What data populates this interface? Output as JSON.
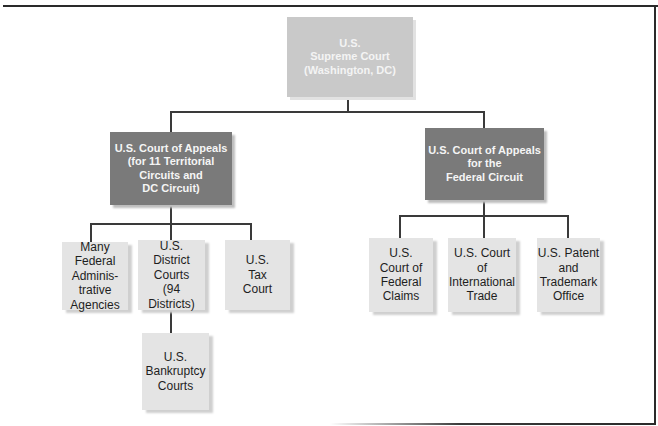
{
  "diagram": {
    "type": "org-chart",
    "colors": {
      "top_box": "#c9c9c9",
      "appeals_box": "#7a7a7a",
      "leaf_box": "#e4e4e4",
      "connector": "#3a3a3a"
    },
    "root": {
      "label": "U.S.\nSupreme Court\n(Washington, DC)"
    },
    "appeals": [
      {
        "label": "U.S. Court of Appeals\n(for 11 Territorial\nCircuits and\nDC Circuit)",
        "children": [
          {
            "label": "Many\nFederal\nAdminis-\ntrative\nAgencies"
          },
          {
            "label": "U.S.\nDistrict\nCourts\n(94\nDistricts)",
            "children": [
              {
                "label": "U.S.\nBankruptcy\nCourts"
              }
            ]
          },
          {
            "label": "U.S.\nTax\nCourt"
          }
        ]
      },
      {
        "label": "U.S. Court of Appeals\nfor the\nFederal Circuit",
        "children": [
          {
            "label": "U.S.\nCourt of\nFederal\nClaims"
          },
          {
            "label": "U.S. Court\nof\nInternational\nTrade"
          },
          {
            "label": "U.S. Patent\nand\nTrademark\nOffice"
          }
        ]
      }
    ]
  }
}
